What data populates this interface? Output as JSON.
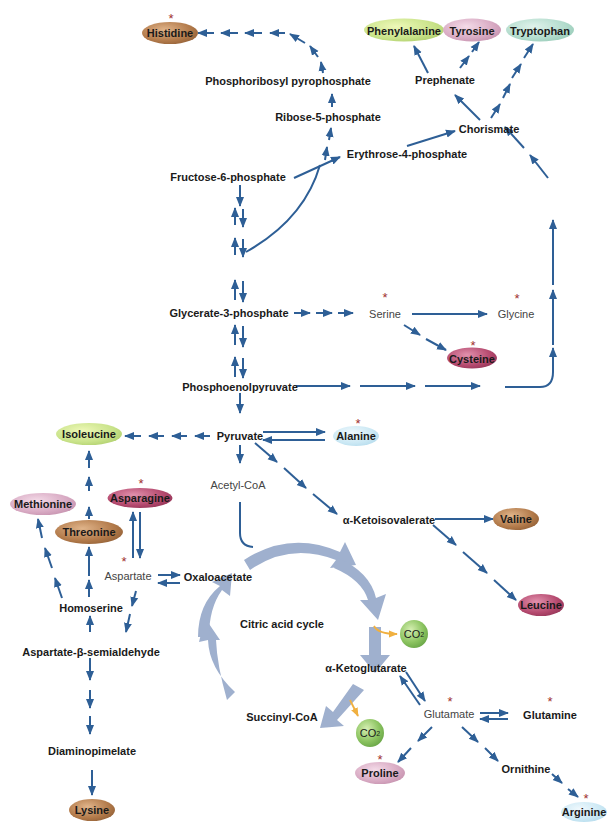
{
  "colors": {
    "arrow": "#2e5f96",
    "cycle": "#9aaccc",
    "co2_arrow": "#f0b040",
    "star": "#a0302f"
  },
  "amino_acids": {
    "histidine": {
      "label": "Histidine",
      "essential_star": true
    },
    "phenylalanine": {
      "label": "Phenylalanine",
      "essential_star": false
    },
    "tyrosine": {
      "label": "Tyrosine",
      "essential_star": false
    },
    "tryptophan": {
      "label": "Tryptophan",
      "essential_star": false
    },
    "cysteine": {
      "label": "Cysteine",
      "essential_star": true
    },
    "alanine": {
      "label": "Alanine",
      "essential_star": true
    },
    "isoleucine": {
      "label": "Isoleucine",
      "essential_star": false
    },
    "methionine": {
      "label": "Methionine",
      "essential_star": false
    },
    "asparagine": {
      "label": "Asparagine",
      "essential_star": true
    },
    "threonine": {
      "label": "Threonine",
      "essential_star": false
    },
    "valine": {
      "label": "Valine",
      "essential_star": false
    },
    "leucine": {
      "label": "Leucine",
      "essential_star": false
    },
    "proline": {
      "label": "Proline",
      "essential_star": true
    },
    "arginine": {
      "label": "Arginine",
      "essential_star": true
    },
    "lysine": {
      "label": "Lysine",
      "essential_star": false
    }
  },
  "intermediates": {
    "prpp": "Phosphoribosyl pyrophosphate",
    "ribose5p": "Ribose-5-phosphate",
    "prephenate": "Prephenate",
    "chorismate": "Chorismate",
    "erythrose4p": "Erythrose-4-phosphate",
    "fructose6p": "Fructose-6-phosphate",
    "glycerate3p": "Glycerate-3-phosphate",
    "serine": "Serine",
    "glycine": "Glycine",
    "pep": "Phosphoenolpyruvate",
    "pyruvate": "Pyruvate",
    "acetylcoa": "Acetyl-CoA",
    "ketoisovalerate": "α-Ketoisovalerate",
    "aspartate": "Aspartate",
    "oxaloacetate": "Oxaloacetate",
    "homoserine": "Homoserine",
    "asa": "Aspartate-β-semialdehyde",
    "citric_cycle": "Citric acid cycle",
    "ketoglutarate": "α-Ketoglutarate",
    "succinylcoa": "Succinyl-CoA",
    "glutamate": "Glutamate",
    "glutamine": "Glutamine",
    "ornithine": "Ornithine",
    "diaminopimelate": "Diaminopimelate"
  },
  "co2": {
    "label": "CO",
    "subscript": "2"
  },
  "stars": {
    "symbol": "*"
  }
}
